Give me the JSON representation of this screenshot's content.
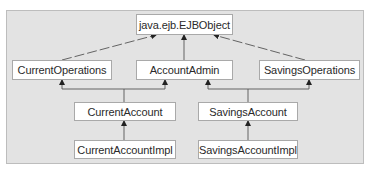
{
  "diagram": {
    "type": "class-hierarchy",
    "nodes": {
      "ejbobject": {
        "label": "java.ejb.EJBObject"
      },
      "current_operations": {
        "label": "CurrentOperations"
      },
      "account_admin": {
        "label": "AccountAdmin"
      },
      "savings_operations": {
        "label": "SavingsOperations"
      },
      "current_account": {
        "label": "CurrentAccount"
      },
      "savings_account": {
        "label": "SavingsAccount"
      },
      "current_account_impl": {
        "label": "CurrentAccountImpl"
      },
      "savings_account_impl": {
        "label": "SavingsAccountImpl"
      }
    },
    "edges": [
      {
        "from": "CurrentOperations",
        "to": "java.ejb.EJBObject"
      },
      {
        "from": "AccountAdmin",
        "to": "java.ejb.EJBObject"
      },
      {
        "from": "SavingsOperations",
        "to": "java.ejb.EJBObject"
      },
      {
        "from": "CurrentAccount",
        "to": "CurrentOperations"
      },
      {
        "from": "CurrentAccount",
        "to": "AccountAdmin"
      },
      {
        "from": "SavingsAccount",
        "to": "AccountAdmin"
      },
      {
        "from": "SavingsAccount",
        "to": "SavingsOperations"
      },
      {
        "from": "CurrentAccountImpl",
        "to": "CurrentAccount"
      },
      {
        "from": "SavingsAccountImpl",
        "to": "SavingsAccount"
      }
    ],
    "colors": {
      "panel": "#e3e3e3",
      "box": "#ffffff",
      "line": "#555555"
    }
  }
}
